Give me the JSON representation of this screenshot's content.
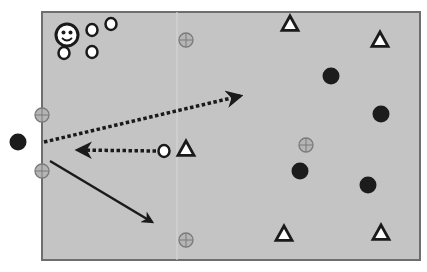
{
  "diagram": {
    "type": "tactical-drill-diagram",
    "field": {
      "x": 42,
      "y": 12,
      "width": 378,
      "height": 248,
      "fill": "#c4c4c4",
      "border": "#6e6e6e"
    },
    "coach": {
      "label": "smiley-face-coach",
      "x": 67,
      "y": 35,
      "r": 11
    },
    "white_circle_players": [
      {
        "x": 92,
        "y": 30
      },
      {
        "x": 111,
        "y": 24
      },
      {
        "x": 64,
        "y": 53
      },
      {
        "x": 92,
        "y": 52
      },
      {
        "x": 164,
        "y": 151
      }
    ],
    "black_circle_players": [
      {
        "x": 18,
        "y": 142
      },
      {
        "x": 331,
        "y": 76
      },
      {
        "x": 381,
        "y": 114
      },
      {
        "x": 300,
        "y": 171
      },
      {
        "x": 368,
        "y": 185
      }
    ],
    "triangle_players": [
      {
        "x": 290,
        "y": 24
      },
      {
        "x": 380,
        "y": 40
      },
      {
        "x": 186,
        "y": 149
      },
      {
        "x": 284,
        "y": 234
      },
      {
        "x": 381,
        "y": 233
      }
    ],
    "cone_markers": [
      {
        "x": 186,
        "y": 40
      },
      {
        "x": 42,
        "y": 115
      },
      {
        "x": 42,
        "y": 171
      },
      {
        "x": 306,
        "y": 145
      },
      {
        "x": 186,
        "y": 240
      }
    ],
    "arrows": [
      {
        "style": "dotted",
        "x1": 44,
        "y1": 142,
        "x2": 240,
        "y2": 96,
        "meaning": "pass"
      },
      {
        "style": "dotted",
        "x1": 156,
        "y1": 151,
        "x2": 78,
        "y2": 150,
        "meaning": "pass"
      },
      {
        "style": "solid",
        "x1": 50,
        "y1": 161,
        "x2": 152,
        "y2": 222,
        "meaning": "run"
      }
    ],
    "colors": {
      "field": "#c4c4c4",
      "outline": "#1a1a1a",
      "black_player": "#1c1c1c",
      "white_player": "#ffffff",
      "cone_fill": "#b5b5b5",
      "cone_stroke": "#7a7a7a"
    }
  }
}
